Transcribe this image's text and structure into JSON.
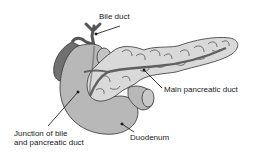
{
  "diagram": {
    "labels": {
      "bile_duct": "Bile duct",
      "main_pancreatic_duct": "Main pancreatic duct",
      "junction_line1": "Junction of bile",
      "junction_line2": "and pancreatic duct",
      "duodenum": "Duodenum"
    },
    "colors": {
      "duodenum_fill": "#b8b8b8",
      "pancreas_fill": "#d9d9d9",
      "gallbladder_fill": "#707070",
      "duct_fill": "#606060",
      "outline": "#333333",
      "text": "#222222"
    }
  }
}
